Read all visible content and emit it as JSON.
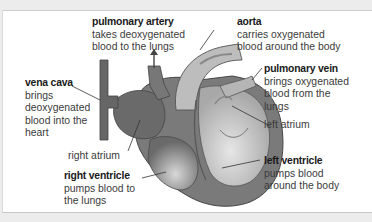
{
  "diagram": {
    "colors": {
      "background": "#ffffff",
      "frame": "#ececec",
      "deoxygenated_side": "#6e6e6e",
      "oxygenated_side": "#b9b9b9",
      "outline": "#4a4a4a",
      "label_text": "#3b3b3b",
      "title_text": "#1a1a1a"
    },
    "labels": {
      "pulmonary_artery": {
        "title": "pulmonary artery",
        "lines": [
          "takes deoxygenated",
          "blood to the lungs"
        ]
      },
      "aorta": {
        "title": "aorta",
        "lines": [
          "carries oxygenated",
          "blood around the body"
        ]
      },
      "vena_cava": {
        "title": "vena cava",
        "lines": [
          "brings",
          "deoxygenated",
          "blood into the",
          "heart"
        ]
      },
      "pulmonary_vein": {
        "title": "pulmonary vein",
        "lines": [
          "brings oxygenated",
          "blood from the",
          "lungs"
        ]
      },
      "left_atrium": {
        "title": "",
        "lines": [
          "left atrium"
        ]
      },
      "right_atrium": {
        "title": "",
        "lines": [
          "right atrium"
        ]
      },
      "right_ventricle": {
        "title": "right ventricle",
        "lines": [
          "pumps blood to",
          "the lungs"
        ]
      },
      "left_ventricle": {
        "title": "left ventricle",
        "lines": [
          "pumps blood",
          "around the body"
        ]
      }
    }
  }
}
